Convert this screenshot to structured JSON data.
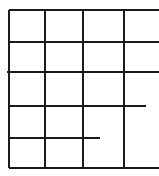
{
  "diagram": {
    "type": "grid-lines",
    "stroke_color": "#1a1a1a",
    "stroke_width": 2,
    "background": "#ffffff",
    "horizontal_lines": [
      {
        "y": 10,
        "x1": 9,
        "x2": 159
      },
      {
        "y": 42,
        "x1": 9,
        "x2": 159
      },
      {
        "y": 72,
        "x1": 7,
        "x2": 159
      },
      {
        "y": 106,
        "x1": 9,
        "x2": 146
      },
      {
        "y": 138,
        "x1": 9,
        "x2": 100
      },
      {
        "y": 168,
        "x1": 9,
        "x2": 159
      }
    ],
    "vertical_lines": [
      {
        "x": 9,
        "y1": 10,
        "y2": 168
      },
      {
        "x": 45,
        "y1": 10,
        "y2": 168
      },
      {
        "x": 83,
        "y1": 10,
        "y2": 168
      },
      {
        "x": 124,
        "y1": 10,
        "y2": 168
      }
    ]
  }
}
